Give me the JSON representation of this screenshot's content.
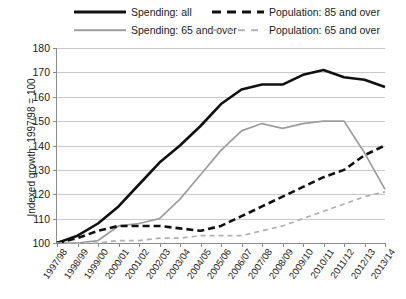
{
  "legend": {
    "items": [
      {
        "label": "Spending: all",
        "style": "solid-thick",
        "color": "#111111"
      },
      {
        "label": "Population: 85 and over",
        "style": "dash-thick",
        "color": "#111111"
      },
      {
        "label": "Spending: 65 and over",
        "style": "solid-thin",
        "color": "#9d9d9d"
      },
      {
        "label": "Population: 65 and over",
        "style": "dash-thin",
        "color": "#b0b0b0"
      }
    ]
  },
  "chart_data": {
    "type": "line",
    "title": "",
    "xlabel": "",
    "ylabel": "Indexed growth: 1997/98 = 100",
    "ylim": [
      100,
      180
    ],
    "yticks": [
      100,
      110,
      120,
      130,
      140,
      150,
      160,
      170,
      180
    ],
    "grid": true,
    "legend_position": "top",
    "categories": [
      "1997/98",
      "1998/99",
      "1999/00",
      "2000/01",
      "2001/02",
      "2002/03",
      "2003/04",
      "2004/05",
      "2005/06",
      "2006/07",
      "2007/08",
      "2008/09",
      "2009/10",
      "2010/11",
      "2011/12",
      "2012/13",
      "2013/14"
    ],
    "series": [
      {
        "name": "Spending: all",
        "color": "#111111",
        "style": "solid-thick",
        "values": [
          100,
          103,
          108,
          115,
          124,
          133,
          140,
          148,
          157,
          163,
          165,
          165,
          169,
          171,
          168,
          167,
          164
        ]
      },
      {
        "name": "Spending: 65 and over",
        "color": "#9d9d9d",
        "style": "solid-thin",
        "values": [
          100,
          100,
          101,
          107,
          108,
          110,
          118,
          128,
          138,
          146,
          149,
          147,
          149,
          150,
          150,
          137,
          122
        ]
      },
      {
        "name": "Population: 85 and over",
        "color": "#111111",
        "style": "dash-thick",
        "values": [
          100,
          102,
          105,
          107,
          107,
          107,
          106,
          105,
          107,
          111,
          115,
          119,
          123,
          127,
          130,
          136,
          140
        ]
      },
      {
        "name": "Population: 65 and over",
        "color": "#b0b0b0",
        "style": "dash-thin",
        "values": [
          100,
          100,
          100,
          101,
          101,
          102,
          102,
          103,
          103,
          103,
          105,
          107,
          110,
          113,
          116,
          119,
          121
        ]
      }
    ]
  }
}
